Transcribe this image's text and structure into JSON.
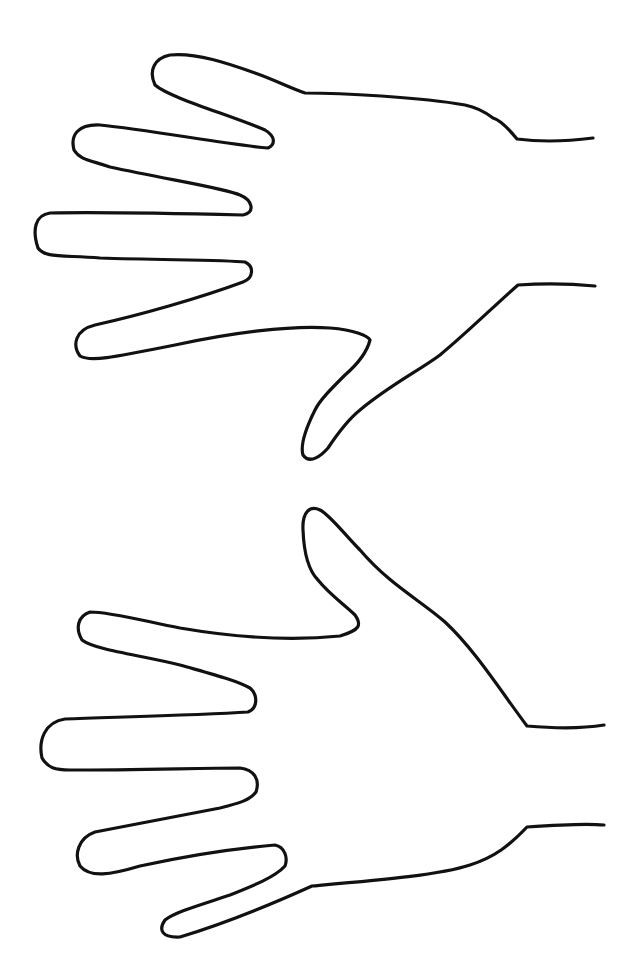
{
  "figure": {
    "line_color": "#111111",
    "background": "#ffffff",
    "hands": [
      {
        "name": "top-hand",
        "path": "M593,138 C570,141 540,142 517,139 C508,128 500,120 493,118 C480,108 470,106 465,105 C420,97 340,93 305,93 C290,88 275,80 255,73 C230,64 195,52 170,55 C155,58 148,70 155,85 C170,98 230,115 265,130 C275,136 276,144 268,148 C230,145 150,130 100,125 C78,124 70,135 74,150 C80,160 90,160 110,167 C170,180 225,188 240,195 C252,200 256,212 243,215 C200,214 100,212 50,213 C35,215 32,230 38,248 C45,258 60,255 100,258 C160,260 225,260 245,262 C254,266 254,278 243,282 C200,298 140,315 95,325 C75,330 72,345 80,356 C90,362 110,358 175,345 C230,333 290,325 330,328 C355,330 368,336 370,340 C367,352 360,362 345,375 C330,390 320,400 315,410 C305,430 300,445 303,455 C310,465 322,455 328,448 C340,430 350,418 360,410 C390,385 420,370 440,355 C470,330 495,305 518,285 C545,283 575,284 595,286"
      },
      {
        "name": "bottom-hand",
        "path": "M604,725 C580,729 550,728 527,726 C500,690 475,650 445,622 C420,600 390,585 360,550 C345,535 330,515 320,510 C310,505 302,512 303,530 C304,555 310,572 318,580 C330,595 345,605 355,615 C362,625 360,630 340,636 C300,640 250,640 180,628 C140,620 110,612 90,612 C78,616 75,628 82,640 C95,650 140,655 180,665 C215,675 235,680 250,688 C258,695 258,708 248,712 C200,715 120,717 65,719 C45,722 38,740 42,758 C48,768 55,770 70,770 C140,770 200,768 240,768 C255,770 260,780 256,792 C250,800 240,803 220,808 C170,818 130,825 95,832 C78,838 74,855 80,866 C90,878 110,875 140,866 C190,855 240,848 275,845 C285,847 288,858 285,866 C275,877 255,885 230,895 C200,905 175,912 165,920 C158,930 162,938 180,937 C220,925 270,905 312,886 C380,880 440,875 470,865 C495,857 510,845 527,827 C555,825 585,823 604,825"
      }
    ]
  }
}
